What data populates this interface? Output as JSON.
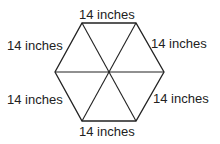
{
  "diagram": {
    "shape": "regular hexagon divided into 6 equilateral triangles",
    "labels": {
      "top": "14 inches",
      "upper_left": "14 inches",
      "upper_right": "14 inches",
      "lower_left": "14 inches",
      "lower_right": "14 inches",
      "bottom": "14 inches"
    },
    "colors": {
      "stroke": "#222222",
      "text": "#222222",
      "background": "#ffffff"
    }
  }
}
